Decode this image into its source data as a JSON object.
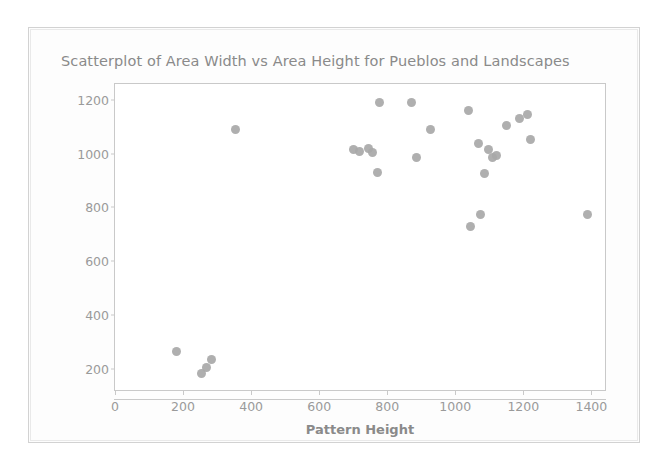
{
  "panel": {
    "background": "#fdfdfd",
    "border_color": "#d2d2d2"
  },
  "chart_data": {
    "type": "scatter",
    "title": "Scatterplot of Area Width vs  Area Height for Pueblos and Landscapes",
    "xlabel": "Pattern Height",
    "ylabel": "",
    "xlim": [
      0,
      1440
    ],
    "ylim": [
      120,
      1260
    ],
    "xticks": [
      0,
      200,
      400,
      600,
      800,
      1000,
      1200,
      1400
    ],
    "yticks": [
      200,
      400,
      600,
      800,
      1000,
      1200
    ],
    "xticklabels": [
      "0",
      "200",
      "400",
      "600",
      "800",
      "1000",
      "1200",
      "1400"
    ],
    "yticklabels": [
      "200",
      "400",
      "600",
      "800",
      "1000",
      "1200"
    ],
    "grid": false,
    "legend": null,
    "marker_color": "#a8a8a8",
    "series": [
      {
        "name": "Pueblos and Landscapes",
        "points": [
          [
            180,
            265
          ],
          [
            255,
            180
          ],
          [
            268,
            205
          ],
          [
            285,
            235
          ],
          [
            355,
            1090
          ],
          [
            700,
            1015
          ],
          [
            718,
            1010
          ],
          [
            745,
            1020
          ],
          [
            758,
            1005
          ],
          [
            770,
            930
          ],
          [
            778,
            1190
          ],
          [
            872,
            1190
          ],
          [
            885,
            985
          ],
          [
            928,
            1090
          ],
          [
            1040,
            1160
          ],
          [
            1045,
            730
          ],
          [
            1068,
            1040
          ],
          [
            1075,
            775
          ],
          [
            1085,
            925
          ],
          [
            1098,
            1015
          ],
          [
            1110,
            985
          ],
          [
            1120,
            995
          ],
          [
            1150,
            1105
          ],
          [
            1188,
            1130
          ],
          [
            1212,
            1148
          ],
          [
            1222,
            1055
          ],
          [
            1390,
            775
          ]
        ]
      }
    ]
  }
}
